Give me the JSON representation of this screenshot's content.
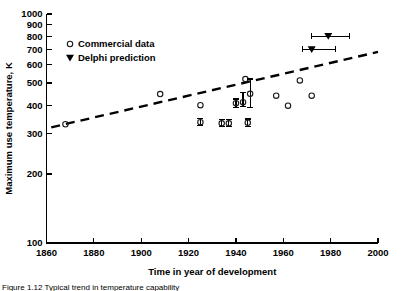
{
  "chart_data": {
    "type": "scatter",
    "title": "",
    "xlabel": "Time in year of development",
    "ylabel": "Maximum use temperature, K",
    "xlim": [
      1860,
      2000
    ],
    "ylim": [
      100,
      1000
    ],
    "yscale": "log",
    "grid": false,
    "xticks": [
      1860,
      1880,
      1900,
      1920,
      1940,
      1960,
      1980,
      2000
    ],
    "xtick_labels": [
      "1860",
      "1880",
      "1900",
      "1920",
      "1940",
      "1960",
      "1980",
      "2000"
    ],
    "yticks": [
      100,
      200,
      300,
      400,
      500,
      600,
      700,
      800,
      900,
      1000
    ],
    "ytick_labels": [
      "100",
      "200",
      "300",
      "400",
      "500",
      "600",
      "700",
      "800",
      "900",
      "1000"
    ],
    "legend_position": "upper-left-inside",
    "legend": [
      {
        "label": "Commercial data",
        "marker": "open-circle"
      },
      {
        "label": "Delphi prediction",
        "marker": "filled-triangle-down"
      }
    ],
    "series": [
      {
        "name": "Commercial data",
        "marker": "open-circle",
        "points": [
          {
            "x": 1868,
            "y": 330
          },
          {
            "x": 1908,
            "y": 447
          },
          {
            "x": 1925,
            "y": 400
          },
          {
            "x": 1925,
            "y": 337,
            "yerr_low": 325,
            "yerr_high": 350
          },
          {
            "x": 1934,
            "y": 333,
            "yerr_low": 322,
            "yerr_high": 345
          },
          {
            "x": 1937,
            "y": 333,
            "yerr_low": 322,
            "yerr_high": 345
          },
          {
            "x": 1940,
            "y": 408,
            "yerr_low": 392,
            "yerr_high": 425
          },
          {
            "x": 1943,
            "y": 412,
            "yerr_low": 395,
            "yerr_high": 455
          },
          {
            "x": 1944,
            "y": 520
          },
          {
            "x": 1945,
            "y": 335,
            "yerr_low": 323,
            "yerr_high": 348
          },
          {
            "x": 1946,
            "y": 448,
            "yerr_low": 390,
            "yerr_high": 520
          },
          {
            "x": 1957,
            "y": 440
          },
          {
            "x": 1962,
            "y": 398
          },
          {
            "x": 1967,
            "y": 513
          },
          {
            "x": 1972,
            "y": 440
          }
        ]
      },
      {
        "name": "Delphi prediction",
        "marker": "filled-triangle-down",
        "points": [
          {
            "x": 1979,
            "y": 800,
            "xerr_low": 1972,
            "xerr_high": 1988
          },
          {
            "x": 1972,
            "y": 700,
            "xerr_low": 1968,
            "xerr_high": 1982
          }
        ]
      }
    ],
    "trend_line": {
      "style": "dashed",
      "x_start": 1862,
      "y_start": 320,
      "x_end": 2000,
      "y_end": 683
    }
  },
  "caption": {
    "text": "Figure 1.12 Typical trend in  temperature capability"
  }
}
